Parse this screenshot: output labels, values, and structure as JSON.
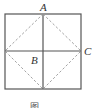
{
  "figure": {
    "points": {
      "A": {
        "label": "A",
        "x": 43,
        "y": 11
      },
      "B": {
        "label": "B",
        "x": 36,
        "y": 62
      },
      "C": {
        "label": "C",
        "x": 89,
        "y": 55
      }
    },
    "square": {
      "x": 5,
      "y": 14,
      "size": 76
    },
    "midlines": true,
    "diamond_dashed": true,
    "caption": "图 ……",
    "colors": {
      "stroke": "#555555",
      "dashed": "#999999"
    }
  }
}
